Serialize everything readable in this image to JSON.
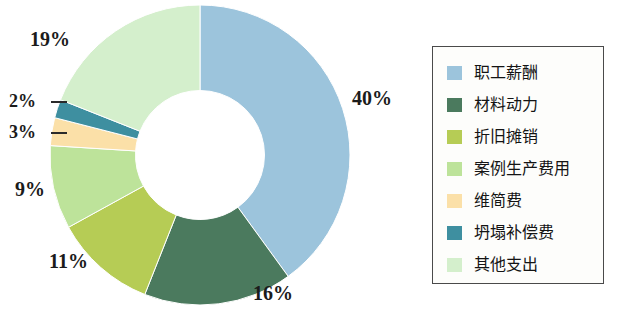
{
  "chart_data": {
    "type": "pie",
    "variant": "donut",
    "title": "",
    "subtitle": "",
    "xlabel": "",
    "ylabel": "",
    "grid": false,
    "legend_position": "right",
    "value_unit": "%",
    "categories": [
      "职工薪酬",
      "材料动力",
      "折旧摊销",
      "案例生产费用",
      "维简费",
      "坍塌补偿费",
      "其他支出"
    ],
    "values": [
      40,
      16,
      11,
      9,
      3,
      2,
      19
    ],
    "labels": [
      "40%",
      "16%",
      "11%",
      "9%",
      "3%",
      "2%",
      "19%"
    ],
    "colors": [
      "#9CC4DC",
      "#4B7A5E",
      "#B6CC55",
      "#BDE39A",
      "#FBE0A8",
      "#3E8FA0",
      "#D4EFCC"
    ],
    "start_angle_deg": 0,
    "direction": "clockwise",
    "inner_radius_ratio": 0.43
  },
  "legend": {
    "items": [
      {
        "label": "职工薪酬",
        "color": "#9CC4DC"
      },
      {
        "label": "材料动力",
        "color": "#4B7A5E"
      },
      {
        "label": "折旧摊销",
        "color": "#B6CC55"
      },
      {
        "label": "案例生产费用",
        "color": "#BDE39A"
      },
      {
        "label": "维简费",
        "color": "#FBE0A8"
      },
      {
        "label": "坍塌补偿费",
        "color": "#3E8FA0"
      },
      {
        "label": "其他支出",
        "color": "#D4EFCC"
      }
    ]
  },
  "data_labels": {
    "employee_comp": "40%",
    "materials_power": "16%",
    "depreciation": "11%",
    "case_production": "9%",
    "maintenance": "3%",
    "collapse_comp": "2%",
    "other": "19%"
  }
}
